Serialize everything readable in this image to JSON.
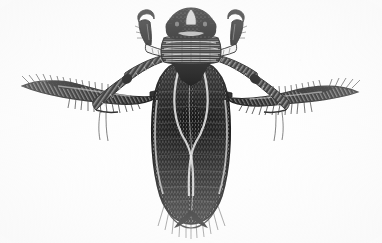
{
  "document": {
    "kind": "scanned-line-art-illustration",
    "medium": "pen-and-ink stipple and hatching",
    "background_color": "#fefefe",
    "ink_color": "#141414",
    "mid_tone_color": "#4a4a4a",
    "light_tone_color": "#8c8c8c",
    "width_px": 382,
    "height_px": 243,
    "has_text": false,
    "has_border": false,
    "caption": ""
  },
  "subject": {
    "name": "aquatic true bug",
    "common_name": "water boatman / backswimmer",
    "view": "dorsal",
    "orientation": "head at top, abdomen at bottom",
    "symmetry": "bilateral, mirrored left and right"
  },
  "anatomy": {
    "head": {
      "label": "head",
      "center_x": 191,
      "center_y": 26,
      "width": 46,
      "height": 30,
      "tone": "dark",
      "notes": "broad triangular head with pale median notch and dark lateral eyes"
    },
    "eyes": {
      "label": "compound-eyes",
      "left_x": 175,
      "right_x": 208,
      "y": 27,
      "radius": 8,
      "tone": "black"
    },
    "pronotum": {
      "label": "pronotum",
      "center_x": 191,
      "center_y": 50,
      "width": 58,
      "height": 24,
      "tone": "banded",
      "band_count": 5,
      "notes": "horizontal striated transverse bands"
    },
    "scutellum": {
      "label": "scutellum",
      "center_x": 191,
      "center_y": 68,
      "width": 40,
      "height": 16,
      "tone": "dark"
    },
    "wings": {
      "label": "forewings-hemelytra",
      "center_x": 191,
      "top_y": 60,
      "bottom_y": 222,
      "half_width": 38,
      "tone": "very dark with dense vertical hatching",
      "seam_pattern": "X-crossing pale seam at mid-abdomen",
      "crossing_y": 140,
      "tip_shape": "paired rounded lobes",
      "fringe": "fine radiating hairs at apex"
    },
    "abdomen": {
      "label": "abdomen",
      "center_x": 191,
      "center_y": 165,
      "width": 70,
      "height": 110,
      "tone": "dark"
    }
  },
  "legs": {
    "foreleg_left": {
      "label": "raptorial-foreleg-left",
      "side": "left",
      "origin_x": 168,
      "origin_y": 48,
      "elbow_x": 148,
      "elbow_y": 38,
      "tip_x": 140,
      "tip_y": 18,
      "type": "raptorial grasping leg with hooked tarsal claw",
      "tone": "dark with pale banded tibia"
    },
    "foreleg_right": {
      "label": "raptorial-foreleg-right",
      "side": "right",
      "origin_x": 214,
      "origin_y": 48,
      "elbow_x": 234,
      "elbow_y": 38,
      "tip_x": 242,
      "tip_y": 18,
      "type": "raptorial grasping leg with hooked tarsal claw",
      "tone": "dark with pale banded tibia"
    },
    "midleg_left": {
      "label": "midleg-left",
      "side": "left",
      "origin_x": 166,
      "origin_y": 62,
      "knee_x": 130,
      "knee_y": 78,
      "tip_x": 96,
      "tip_y": 112,
      "type": "banded walking leg",
      "tone": "hatched bands with pale highlights",
      "claw": "two thin dangling tarsal claws"
    },
    "midleg_right": {
      "label": "midleg-right",
      "side": "right",
      "origin_x": 216,
      "origin_y": 62,
      "knee_x": 252,
      "knee_y": 78,
      "tip_x": 286,
      "tip_y": 112,
      "type": "banded walking leg",
      "tone": "hatched bands with pale highlights",
      "claw": "two thin dangling tarsal claws"
    },
    "hindleg_left": {
      "label": "swimming-hindleg-left",
      "side": "left",
      "origin_x": 160,
      "origin_y": 90,
      "mid_x": 100,
      "mid_y": 96,
      "tip_x": 24,
      "tip_y": 86,
      "type": "oar-like swimming leg",
      "tone": "black with dense fringe",
      "fringe": "long swimming hairs along both margins",
      "fringe_count": 26
    },
    "hindleg_right": {
      "label": "swimming-hindleg-right",
      "side": "right",
      "origin_x": 222,
      "origin_y": 90,
      "mid_x": 282,
      "mid_y": 96,
      "tip_x": 358,
      "tip_y": 92,
      "type": "oar-like swimming leg",
      "tone": "black with dense fringe",
      "fringe": "long swimming hairs along both margins",
      "fringe_count": 26
    }
  },
  "rendering": {
    "texture_style": "cross-hatching and stipple",
    "stipple_density": "high on wings and thorax",
    "line_weight_range": "0.4 to 1.6 px",
    "scan_artifacts": "slight gray speckle, soft edges"
  }
}
